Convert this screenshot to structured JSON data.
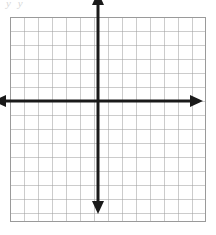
{
  "figure": {
    "background_color": "#ffffff",
    "faint_note": "y  y",
    "faint_note_color": "#d8d8d8"
  },
  "chart_data": {
    "type": "grid",
    "title": "",
    "subtitle": "",
    "xlabel": "",
    "ylabel": "",
    "series": [],
    "x": [],
    "values": [],
    "categories": [],
    "grid": true,
    "legend": false,
    "legend_position": "none",
    "xlim": [
      -7,
      7
    ],
    "ylim": [
      -7,
      7
    ],
    "x_tick_labels": [],
    "y_tick_labels": [],
    "annotations": []
  },
  "grid": {
    "columns": 14,
    "rows": 15,
    "cell_size_px": 14,
    "line_color": "#9a9a9a",
    "line_width_px": 1,
    "left_px": 10,
    "top_px": 17,
    "width_px": 196,
    "height_px": 205
  },
  "axes": {
    "color": "#1a1a1a",
    "stroke_width_px": 3,
    "origin": {
      "x_px": 108,
      "y_px": 118
    },
    "x_axis": {
      "label": "x-axis",
      "start_px": 4,
      "end_px": 212,
      "arrow_left": true,
      "arrow_right": true
    },
    "y_axis": {
      "label": "y-axis",
      "start_px": 10,
      "end_px": 230,
      "arrow_up": true,
      "arrow_down": true
    }
  }
}
